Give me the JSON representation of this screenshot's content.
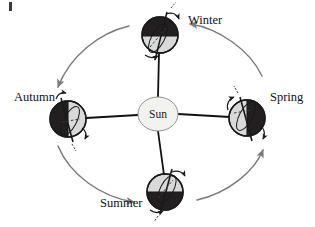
{
  "figure": {
    "background_color": "#ffffff",
    "corner_mark": ""
  },
  "sun": {
    "label": "Sun",
    "cx": 158,
    "cy": 114,
    "rx": 20,
    "ry": 17,
    "fill": "#f2f2ee",
    "stroke": "#8a8a8a"
  },
  "colors": {
    "night_side": "#231f20",
    "day_side": "#d9d9d9",
    "globe_outline": "#1a1a1a",
    "orbit_arc": "#7b7b7b",
    "axis_line": "#111111",
    "text": "#111111"
  },
  "orbit": {
    "center_x": 158,
    "center_y": 114,
    "radius_x": 118,
    "radius_y": 96,
    "direction": "counterclockwise",
    "arrow_count": 4
  },
  "earths": [
    {
      "id": "winter",
      "label": "Winter",
      "label_x": 188,
      "label_y": 24,
      "cx": 160,
      "cy": 35,
      "r": 18,
      "shaded_half": "top",
      "hemisphere_note": "northern hemisphere in darkness",
      "axis_tilt_deg": -23.5
    },
    {
      "id": "spring",
      "label": "Spring",
      "label_x": 272,
      "label_y": 101,
      "cx": 247,
      "cy": 118,
      "r": 18,
      "shaded_half": "right",
      "hemisphere_note": "far side from Sun in darkness",
      "axis_tilt_deg": -23.5
    },
    {
      "id": "summer",
      "label": "Summer",
      "label_x": 100,
      "label_y": 207,
      "cx": 165,
      "cy": 192,
      "r": 18,
      "shaded_half": "bottom",
      "hemisphere_note": "southern hemisphere in darkness",
      "axis_tilt_deg": -23.5
    },
    {
      "id": "autumn",
      "label": "Autumn",
      "label_x": 14,
      "label_y": 101,
      "cx": 68,
      "cy": 119,
      "r": 18,
      "shaded_half": "left",
      "hemisphere_note": "far side from Sun in darkness",
      "axis_tilt_deg": -23.5
    }
  ],
  "radial_lines": [
    {
      "id": "sun-to-winter",
      "from": "sun",
      "to": "winter"
    },
    {
      "id": "sun-to-spring",
      "from": "sun",
      "to": "spring"
    },
    {
      "id": "sun-to-summer",
      "from": "sun",
      "to": "summer"
    },
    {
      "id": "sun-to-autumn",
      "from": "sun",
      "to": "autumn"
    }
  ]
}
